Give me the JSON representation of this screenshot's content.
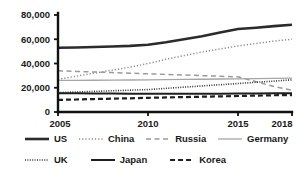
{
  "chart_data": {
    "type": "line",
    "title": "",
    "xlabel": "",
    "ylabel": "",
    "x": [
      2005,
      2010,
      2015,
      2018
    ],
    "xtick_labels": [
      "2005",
      "2010",
      "2015",
      "2018"
    ],
    "ytick_labels": [
      "0",
      "20,000",
      "40,000",
      "60,000",
      "80,000"
    ],
    "ytick_values": [
      0,
      20000,
      40000,
      60000,
      80000
    ],
    "xlim": [
      2005,
      2018
    ],
    "ylim": [
      0,
      80000
    ],
    "grid": false,
    "legend_position": "bottom",
    "series": [
      {
        "name": "US",
        "style": "solid-thick",
        "color": "#2b2b2b",
        "x": [
          2005,
          2006,
          2007,
          2008,
          2009,
          2010,
          2011,
          2012,
          2013,
          2014,
          2015,
          2016,
          2017,
          2018
        ],
        "values": [
          53000,
          53200,
          53600,
          54000,
          54500,
          55500,
          57500,
          60000,
          62500,
          65500,
          68500,
          69500,
          70800,
          72000
        ]
      },
      {
        "name": "China",
        "style": "dotted",
        "color": "#8c8c8c",
        "x": [
          2005,
          2006,
          2007,
          2008,
          2009,
          2010,
          2011,
          2012,
          2013,
          2014,
          2015,
          2016,
          2017,
          2018
        ],
        "values": [
          27000,
          29500,
          32000,
          34500,
          37000,
          40000,
          43500,
          46500,
          49500,
          52000,
          54500,
          56500,
          58500,
          60000
        ]
      },
      {
        "name": "Russia",
        "style": "dashed",
        "color": "#9a9a9a",
        "x": [
          2005,
          2006,
          2007,
          2008,
          2009,
          2010,
          2011,
          2012,
          2013,
          2014,
          2015,
          2016,
          2017,
          2018
        ],
        "values": [
          34000,
          33500,
          33000,
          32500,
          32000,
          31500,
          31000,
          30500,
          30000,
          29500,
          29000,
          25000,
          21000,
          18000
        ]
      },
      {
        "name": "Germany",
        "style": "solid-thin",
        "color": "#a6a6a6",
        "x": [
          2005,
          2006,
          2007,
          2008,
          2009,
          2010,
          2011,
          2012,
          2013,
          2014,
          2015,
          2016,
          2017,
          2018
        ],
        "values": [
          26000,
          26000,
          26200,
          26300,
          26400,
          26500,
          26700,
          26900,
          27000,
          27200,
          27400,
          27600,
          27800,
          28000
        ]
      },
      {
        "name": "UK",
        "style": "dotted-fine",
        "color": "#333333",
        "x": [
          2005,
          2006,
          2007,
          2008,
          2009,
          2010,
          2011,
          2012,
          2013,
          2014,
          2015,
          2016,
          2017,
          2018
        ],
        "values": [
          16000,
          16500,
          17000,
          17500,
          18000,
          18500,
          19500,
          20500,
          21500,
          22500,
          23500,
          24500,
          25500,
          26500
        ]
      },
      {
        "name": "Japan",
        "style": "solid-medium",
        "color": "#1f1f1f",
        "x": [
          2005,
          2006,
          2007,
          2008,
          2009,
          2010,
          2011,
          2012,
          2013,
          2014,
          2015,
          2016,
          2017,
          2018
        ],
        "values": [
          15500,
          15400,
          15300,
          15200,
          15100,
          15100,
          15000,
          15000,
          15000,
          15100,
          15200,
          15300,
          15400,
          15500
        ]
      },
      {
        "name": "Korea",
        "style": "dashed-thick",
        "color": "#1f1f1f",
        "x": [
          2005,
          2006,
          2007,
          2008,
          2009,
          2010,
          2011,
          2012,
          2013,
          2014,
          2015,
          2016,
          2017,
          2018
        ],
        "values": [
          10000,
          10300,
          10700,
          11000,
          11300,
          11700,
          12000,
          12300,
          12600,
          12900,
          13200,
          13500,
          13800,
          14000
        ]
      }
    ]
  },
  "legend": {
    "rows": [
      [
        {
          "label": "US",
          "style": "solid-thick"
        },
        {
          "label": "China",
          "style": "dotted"
        },
        {
          "label": "Russia",
          "style": "dashed"
        },
        {
          "label": "Germany",
          "style": "solid-thin"
        }
      ],
      [
        {
          "label": "UK",
          "style": "dotted-fine"
        },
        {
          "label": "Japan",
          "style": "solid-medium"
        },
        {
          "label": "Korea",
          "style": "dashed-thick"
        }
      ]
    ]
  }
}
